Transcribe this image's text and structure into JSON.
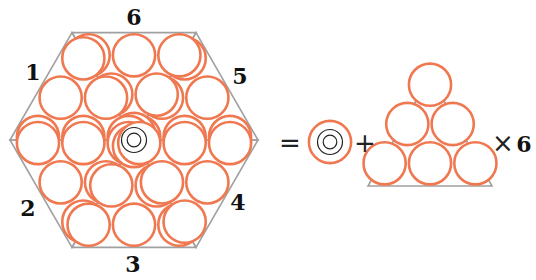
{
  "diagram": {
    "hexagon": {
      "section_labels": [
        "1",
        "2",
        "3",
        "4",
        "5",
        "6"
      ],
      "center_marker": "concentric-circles"
    },
    "equation": {
      "equals": "=",
      "plus": "+",
      "times": "×",
      "multiplier": "6"
    },
    "colors": {
      "circle_stroke": "#f07850",
      "triangle_stroke": "#a0a0a0",
      "center_mark": "#222222",
      "text": "#111111"
    }
  }
}
